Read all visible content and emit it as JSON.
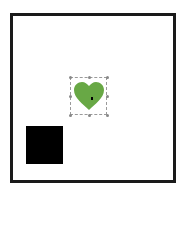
{
  "canvas": {
    "frame_color": "#1a1a1a",
    "background": "#ffffff"
  },
  "shapes": [
    {
      "type": "square",
      "fill": "#000000",
      "selected": false
    },
    {
      "type": "heart",
      "fill": "#68a845",
      "selected": true
    }
  ],
  "selection": {
    "handles": 8,
    "handle_color": "#888888"
  }
}
